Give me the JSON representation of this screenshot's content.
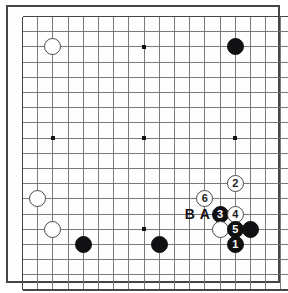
{
  "board": {
    "name": "go-board-diagram",
    "type": "go-problem-diagram",
    "columns": 18,
    "rows": 18,
    "grid_spacing_px": 15.2,
    "origin_x_px": 22.5,
    "origin_y_px": 16.5,
    "line_color": "#6b6b70",
    "edge_line_color": "#454549",
    "frame_color": "#454549",
    "background_color": "#fefefe",
    "black_color": "#111114",
    "white_color": "#ffffff"
  },
  "star_points": [
    {
      "col": 2,
      "row": 2
    },
    {
      "col": 8,
      "row": 2
    },
    {
      "col": 14,
      "row": 2
    },
    {
      "col": 2,
      "row": 8
    },
    {
      "col": 8,
      "row": 8
    },
    {
      "col": 14,
      "row": 8
    },
    {
      "col": 2,
      "row": 14
    },
    {
      "col": 8,
      "row": 14
    },
    {
      "col": 14,
      "row": 14
    }
  ],
  "stones": [
    {
      "name": "white-stone-upper-left",
      "color": "white",
      "col": 2,
      "row": 2,
      "label": ""
    },
    {
      "name": "black-stone-upper-right",
      "color": "black",
      "col": 14,
      "row": 2,
      "label": ""
    },
    {
      "name": "white-stone-lower-left-upper",
      "color": "white",
      "col": 1,
      "row": 12,
      "label": ""
    },
    {
      "name": "white-stone-lower-left-lower",
      "color": "white",
      "col": 2,
      "row": 14,
      "label": ""
    },
    {
      "name": "black-stone-bottom-left",
      "color": "black",
      "col": 4,
      "row": 15,
      "label": ""
    },
    {
      "name": "black-stone-bottom-center",
      "color": "black",
      "col": 9,
      "row": 15,
      "label": ""
    },
    {
      "name": "white-stone-move-2",
      "color": "white",
      "col": 14,
      "row": 11,
      "label": "2"
    },
    {
      "name": "white-stone-move-6",
      "color": "white",
      "col": 12,
      "row": 12,
      "label": "6"
    },
    {
      "name": "black-stone-move-3",
      "color": "black",
      "col": 13,
      "row": 13,
      "label": "3"
    },
    {
      "name": "white-stone-move-4",
      "color": "white",
      "col": 14,
      "row": 13,
      "label": "4"
    },
    {
      "name": "white-stone-contact",
      "color": "white",
      "col": 13,
      "row": 14,
      "label": ""
    },
    {
      "name": "black-stone-move-5",
      "color": "black",
      "col": 14,
      "row": 14,
      "label": "5"
    },
    {
      "name": "black-stone-right-edge",
      "color": "black",
      "col": 15,
      "row": 14,
      "label": ""
    },
    {
      "name": "black-stone-move-1",
      "color": "black",
      "col": 14,
      "row": 15,
      "label": "1"
    }
  ],
  "letter_markers": [
    {
      "name": "marker-letter-b",
      "text": "B",
      "col": 11,
      "row": 13
    },
    {
      "name": "marker-letter-a",
      "text": "A",
      "col": 12,
      "row": 13
    }
  ]
}
